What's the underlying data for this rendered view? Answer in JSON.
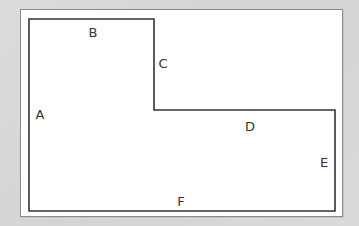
{
  "diagram": {
    "type": "L-shaped polygon outline",
    "colors": {
      "background": "#d9d9d9",
      "frame": "#ffffff",
      "frame_border": "#8a8a8a",
      "shape_stroke": "#333333",
      "label_text": "#333333"
    },
    "labels": {
      "A": "A",
      "B": "B",
      "C": "C",
      "D": "D",
      "E": "E",
      "F": "F"
    },
    "sides": [
      {
        "label": "A",
        "position": "left side"
      },
      {
        "label": "B",
        "position": "top side"
      },
      {
        "label": "C",
        "position": "inner vertical step"
      },
      {
        "label": "D",
        "position": "inner horizontal step"
      },
      {
        "label": "E",
        "position": "right side"
      },
      {
        "label": "F",
        "position": "bottom side"
      }
    ]
  }
}
